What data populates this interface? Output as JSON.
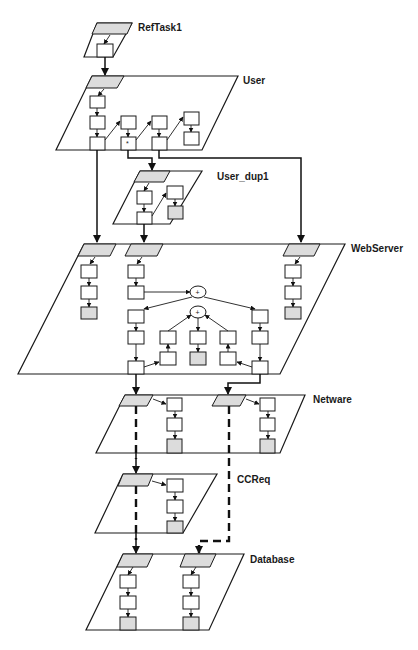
{
  "diagram": {
    "type": "layered-queueing-network",
    "tasks": [
      {
        "id": "reftask1",
        "label": "RefTask1"
      },
      {
        "id": "user",
        "label": "User"
      },
      {
        "id": "user_dup1",
        "label": "User_dup1"
      },
      {
        "id": "webserver",
        "label": "WebServer"
      },
      {
        "id": "netware",
        "label": "Netware"
      },
      {
        "id": "ccreq",
        "label": "CCReq"
      },
      {
        "id": "database",
        "label": "Database"
      }
    ],
    "join_symbols": [
      "+",
      "+"
    ],
    "fork_marker": "*",
    "calls": [
      {
        "from": "RefTask1",
        "to": "User",
        "style": "synchronous"
      },
      {
        "from": "User",
        "to": "User_dup1",
        "style": "synchronous"
      },
      {
        "from": "User",
        "to": "WebServer",
        "style": "synchronous",
        "count": 2
      },
      {
        "from": "User_dup1",
        "to": "WebServer",
        "style": "synchronous"
      },
      {
        "from": "WebServer",
        "to": "Netware",
        "style": "synchronous",
        "count": 2
      },
      {
        "from": "Netware",
        "to": "CCReq",
        "style": "forwarded-dashed"
      },
      {
        "from": "CCReq",
        "to": "Database",
        "style": "forwarded-dashed"
      },
      {
        "from": "Netware",
        "to": "Database",
        "style": "forwarded-dashed"
      }
    ],
    "colors": {
      "line": "#1a1a1a",
      "entry_fill": "#dcdcdc",
      "background": "#ffffff"
    }
  }
}
